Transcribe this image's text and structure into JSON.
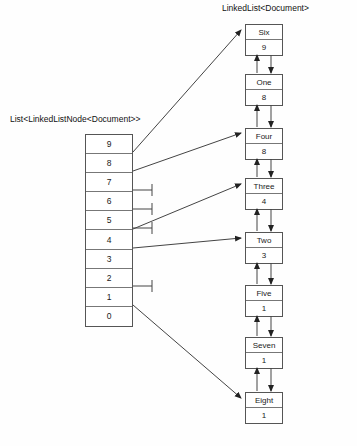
{
  "diagram": {
    "type": "doubly-linked-list-with-index-array",
    "labels": {
      "linked_list_title": "LinkedList<Document>",
      "array_title": "List<LinkedListNode<Document>>"
    },
    "array": {
      "name": "index-array",
      "cells": [
        {
          "index": "9",
          "link": "node-six",
          "null": false
        },
        {
          "index": "8",
          "link": "node-four",
          "null": false
        },
        {
          "index": "7",
          "link": null,
          "null": true
        },
        {
          "index": "6",
          "link": null,
          "null": true
        },
        {
          "index": "5",
          "link": null,
          "null": true
        },
        {
          "index": "4",
          "link": "node-three",
          "null": false
        },
        {
          "index": "3",
          "link": "node-two",
          "null": false
        },
        {
          "index": "2",
          "link": null,
          "null": true
        },
        {
          "index": "1",
          "link": "node-eight",
          "null": false
        },
        {
          "index": "0",
          "link": null,
          "null": false
        }
      ]
    },
    "nodes": [
      {
        "id": "node-six",
        "name": "Six",
        "value": "9"
      },
      {
        "id": "node-one",
        "name": "One",
        "value": "8"
      },
      {
        "id": "node-four",
        "name": "Four",
        "value": "8"
      },
      {
        "id": "node-three",
        "name": "Three",
        "value": "4"
      },
      {
        "id": "node-two",
        "name": "Two",
        "value": "3"
      },
      {
        "id": "node-five",
        "name": "Five",
        "value": "1"
      },
      {
        "id": "node-seven",
        "name": "Seven",
        "value": "1"
      },
      {
        "id": "node-eight",
        "name": "Eight",
        "value": "1"
      }
    ],
    "colors": {
      "stroke": "#555555",
      "inner_stroke": "#777777",
      "background": "#fefefe",
      "text": "#111111"
    }
  }
}
